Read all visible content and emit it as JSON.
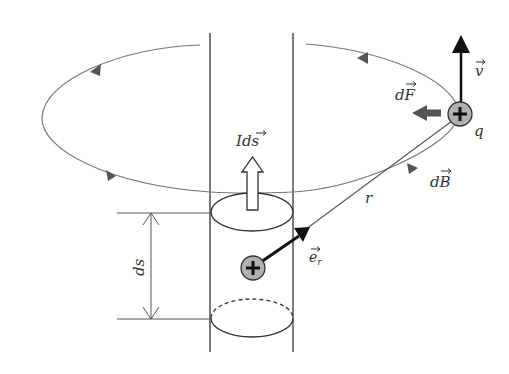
{
  "figure": {
    "labels": {
      "current_element": "Id",
      "current_element_vec": "s",
      "segment_length": "ds",
      "distance": "r",
      "unit_vector": "e",
      "unit_vector_sub": "r",
      "field": "dB",
      "field_prefix": "d",
      "field_vec": "B",
      "force_prefix": "d",
      "force_vec": "F",
      "velocity": "v",
      "charge": "q"
    },
    "symbols": {
      "positive_charge": "+"
    },
    "colors": {
      "line": "#333333",
      "field_line": "#777777",
      "force_arrow": "#555555",
      "charge_fill": "#b0b0b0",
      "background": "#ffffff"
    }
  }
}
